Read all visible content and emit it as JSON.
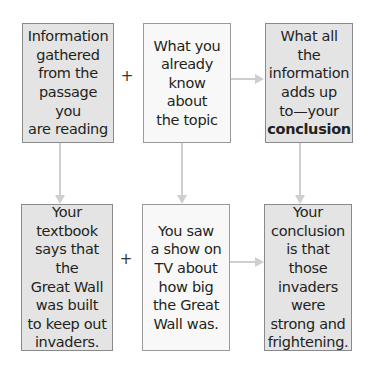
{
  "diagram": {
    "top_row": [
      {
        "id": "passage",
        "text": "Information\ngathered\nfrom the\npassage you\nare reading"
      },
      {
        "id": "known",
        "text": "What you\nalready\nknow about\nthe topic"
      },
      {
        "id": "conclusion",
        "text": "What all the\ninformation\nadds up\nto—your",
        "bold_text": "conclusion"
      }
    ],
    "bottom_row": [
      {
        "id": "example-passage",
        "text": "Your\ntextbook\nsays that the\nGreat Wall\nwas built\nto keep out\ninvaders."
      },
      {
        "id": "example-known",
        "text": "You saw\na show on\nTV about\nhow big\nthe Great\nWall was."
      },
      {
        "id": "example-conclusion",
        "text": "Your\nconclusion\nis that those\ninvaders\nwere\nstrong and\nfrightening."
      }
    ],
    "operators": {
      "plus": "+"
    },
    "connectors": [
      {
        "from": "passage",
        "to": "example-passage",
        "type": "arrow-down"
      },
      {
        "from": "known",
        "to": "example-known",
        "type": "arrow-down"
      },
      {
        "from": "conclusion",
        "to": "example-conclusion",
        "type": "arrow-down"
      },
      {
        "from": "known",
        "to": "conclusion",
        "type": "arrow-right"
      },
      {
        "from": "example-known",
        "to": "example-conclusion",
        "type": "arrow-right"
      }
    ],
    "colors": {
      "shaded_box": "#e4e4e4",
      "light_box": "#f8f8f8",
      "border": "#8a8a8a",
      "connector": "#cfcfcf",
      "text": "#231f20"
    }
  }
}
